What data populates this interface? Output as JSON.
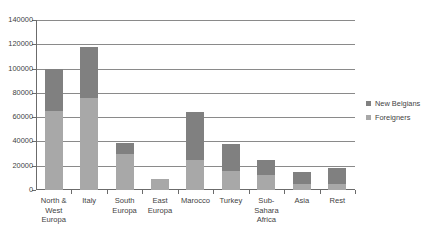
{
  "chart_data": {
    "type": "bar",
    "subtype": "stacked-bar",
    "title": "",
    "xlabel": "",
    "ylabel": "",
    "ylim": [
      0,
      140000
    ],
    "ytick_step": 20000,
    "ytick_labels": [
      "0",
      "20000",
      "40000",
      "60000",
      "80000",
      "100000",
      "120000",
      "140000"
    ],
    "ytick_values": [
      0,
      20000,
      40000,
      60000,
      80000,
      100000,
      120000,
      140000
    ],
    "grid": true,
    "legend_position": "right",
    "categories": [
      "North & West Europa",
      "Italy",
      "South Europa",
      "East Europa",
      "Marocco",
      "Turkey",
      "Sub-Sahara Africa",
      "Asia",
      "Rest"
    ],
    "category_label_lines": [
      [
        "North &",
        "West",
        "Europa"
      ],
      [
        "Italy"
      ],
      [
        "South",
        "Europa"
      ],
      [
        "East",
        "Europa"
      ],
      [
        "Marocco"
      ],
      [
        "Turkey"
      ],
      [
        "Sub-",
        "Sahara",
        "Africa"
      ],
      [
        "Asia"
      ],
      [
        "Rest"
      ]
    ],
    "series": [
      {
        "name": "Foreigners",
        "color": "#a8a8a8",
        "values": [
          65000,
          76000,
          30000,
          9000,
          25000,
          16000,
          12000,
          5000,
          5000
        ]
      },
      {
        "name": "New Belgians",
        "color": "#808080",
        "values": [
          35000,
          42000,
          9000,
          0,
          39000,
          22000,
          13000,
          10000,
          13000
        ]
      }
    ],
    "totals": [
      100000,
      118000,
      39000,
      9000,
      64000,
      38000,
      25000,
      15000,
      18000
    ]
  },
  "legend": {
    "entries": [
      {
        "label": "New Belgians",
        "color": "#808080"
      },
      {
        "label": "Foreigners",
        "color": "#a8a8a8"
      }
    ]
  }
}
